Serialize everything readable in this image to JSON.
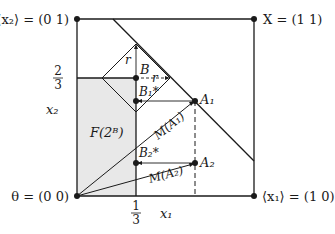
{
  "diagram": {
    "corners": {
      "origin": "θ = (0 0)",
      "top_left": "⟨x₂⟩ = (0 1)",
      "top_right": "X = (1 1)",
      "bottom_right": "⟨x₁⟩ = (1 0)"
    },
    "axes": {
      "x_label": "x₁",
      "y_label": "x₂",
      "x_tick": {
        "num": "1",
        "den": "3"
      },
      "y_tick": {
        "num": "2",
        "den": "3"
      }
    },
    "points": {
      "B": "B",
      "B1": "B₁*",
      "B2": "B₂*",
      "A1": "A₁",
      "A2": "A₂"
    },
    "labels": {
      "r_top": "r",
      "r_right": "r",
      "region": "F(2ᴮ)",
      "m_a1": "M(A₁)",
      "m_a2": "M(A₂)"
    },
    "colors": {
      "ink": "#1a1a1a",
      "shade": "#e6e6e6"
    }
  }
}
